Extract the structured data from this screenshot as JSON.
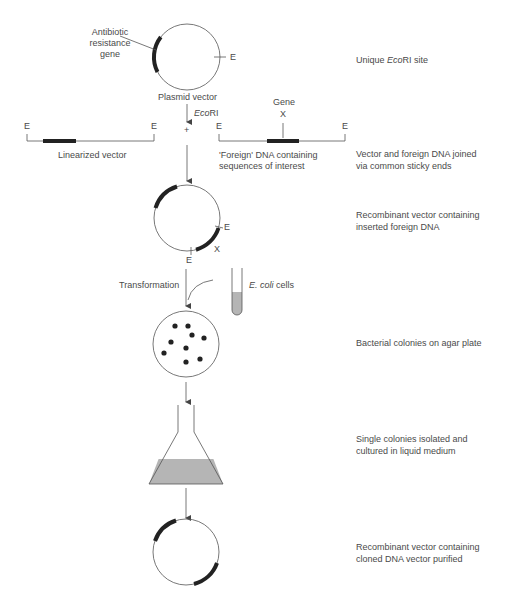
{
  "colors": {
    "line": "#555555",
    "gene_block": "#222222",
    "liquid": "#b5b5b5",
    "text": "#4a4a4a"
  },
  "plasmid": {
    "gene_label_line1": "Antibiotic",
    "gene_label_line2": "resistance",
    "gene_label_line3": "gene",
    "site_label": "E",
    "name": "Plasmid vector",
    "enzyme_label_italic": "Eco",
    "enzyme_label_rest": "RI",
    "plus_sign": "+"
  },
  "linearized": {
    "left_end": "E",
    "right_end": "E",
    "label": "Linearized vector"
  },
  "foreign_dna": {
    "gene_label": "Gene",
    "gene_marker": "X",
    "left_end": "E",
    "right_end": "E",
    "label_line1": "'Foreign' DNA containing",
    "label_line2": "sequences of interest"
  },
  "recombinant": {
    "site_label_right": "E",
    "site_label_bottom": "E",
    "gene_marker": "X"
  },
  "transformation": {
    "label": "Transformation",
    "cells_italic": "E. coli",
    "cells_rest": " cells"
  },
  "steps": [
    {
      "line1_pre": "Unique ",
      "line1_italic": "Eco",
      "line1_post": "RI site",
      "line2": ""
    },
    {
      "line1_pre": "Vector and foreign DNA joined",
      "line1_italic": "",
      "line1_post": "",
      "line2": "via common sticky ends"
    },
    {
      "line1_pre": "Recombinant vector containing",
      "line1_italic": "",
      "line1_post": "",
      "line2": "inserted foreign DNA"
    },
    {
      "line1_pre": "Bacterial colonies on agar plate",
      "line1_italic": "",
      "line1_post": "",
      "line2": ""
    },
    {
      "line1_pre": "Single colonies isolated and",
      "line1_italic": "",
      "line1_post": "",
      "line2": "cultured in liquid medium"
    },
    {
      "line1_pre": "Recombinant vector containing",
      "line1_italic": "",
      "line1_post": "",
      "line2": "cloned DNA vector purified"
    }
  ],
  "colonies": {
    "count": 9
  }
}
